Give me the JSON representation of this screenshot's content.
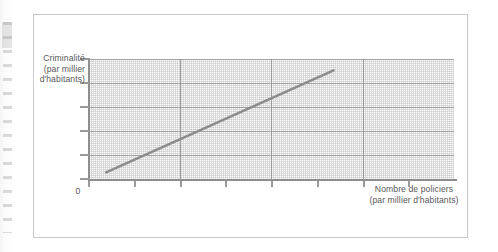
{
  "figure": {
    "caption": "",
    "background_color": "#ffffff",
    "border_color": "#c9c9c9"
  },
  "chart_data": {
    "type": "line",
    "title": "",
    "subtitle": "",
    "xlabel": "Nombre de policiers (par millier d'habitants)",
    "ylabel": "Criminalité (par millier d'habitants)",
    "xlabel_lines": [
      "Nombre de policiers",
      "(par millier d'habitants)"
    ],
    "ylabel_lines": [
      "Criminalité",
      "(par millier",
      "d'habitants)"
    ],
    "origin_label": "0",
    "grid": true,
    "grid_major_columns": 4,
    "grid_major_rows": 5,
    "grid_minor": true,
    "legend": false,
    "legend_position": "none",
    "axis_tick_labels_x": [],
    "axis_tick_labels_y": [],
    "x_tick_count": 8,
    "y_tick_count": 6,
    "xlim": [
      0,
      1
    ],
    "ylim": [
      0,
      1
    ],
    "annotations": [],
    "series": [
      {
        "name": "Relation criminalité / policiers",
        "color": "#8c8c8c",
        "line_width": 2.6,
        "style": "straight-line",
        "points": [
          {
            "x": 0.047,
            "y": 0.055
          },
          {
            "x": 0.67,
            "y": 0.905
          }
        ]
      }
    ]
  },
  "labels": {
    "y_axis_line1": "Criminalité",
    "y_axis_line2": "(par millier",
    "y_axis_line3": "d'habitants)",
    "x_axis_line1": "Nombre de policiers",
    "x_axis_line2": "(par millier d'habitants)",
    "origin": "0"
  },
  "colors": {
    "series_line": "#8c8c8c",
    "axis": "#8e8e8e",
    "grid_major": "#8c8c8c",
    "grid_minor": "#969696",
    "text": "#58585a",
    "card_border": "#c9c9c9"
  }
}
